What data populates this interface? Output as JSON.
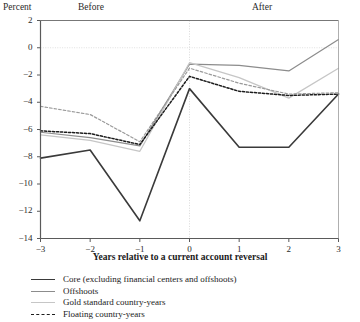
{
  "header": {
    "y_axis_unit_label": "Percent",
    "before_label": "Before",
    "after_label": "After"
  },
  "axis": {
    "x_title": "Years relative to a current account reversal"
  },
  "legend": {
    "items": [
      {
        "label": "Core (excluding financial centers and offshoots)",
        "color": "#3a3a3a",
        "style": "solid",
        "width": 1.6
      },
      {
        "label": "Offshoots",
        "color": "#8c8c8c",
        "style": "solid",
        "width": 1.2
      },
      {
        "label": "Gold standard country-years",
        "color": "#c6c6c6",
        "style": "solid",
        "width": 1.2
      },
      {
        "label": "Floating country-years",
        "color": "#1c1c1c",
        "style": "dashed",
        "width": 1.5
      }
    ]
  },
  "chart_data": {
    "type": "line",
    "title": "",
    "xlabel": "Years relative to a current account reversal",
    "ylabel": "Percent",
    "x": [
      -3,
      -2,
      -1,
      0,
      1,
      2,
      3
    ],
    "xtick_labels": [
      "−3",
      "−2",
      "−1",
      "0",
      "1",
      "2",
      "3"
    ],
    "ytick_labels": [
      "2",
      "0",
      "−2",
      "−4",
      "−6",
      "−8",
      "−10",
      "−12",
      "−14"
    ],
    "yticks": [
      2,
      0,
      -2,
      -4,
      -6,
      -8,
      -10,
      -12,
      -14
    ],
    "xlim": [
      -3,
      3
    ],
    "ylim": [
      -14,
      2
    ],
    "grid": "horizontal-zero-and-top",
    "legend_position": "below",
    "annotations": [
      {
        "text": "Before",
        "x": -1.7,
        "note": "region label left of reversal"
      },
      {
        "text": "After",
        "x": 1.3,
        "note": "region label right of reversal"
      },
      {
        "text": "reversal-marker",
        "x": 0,
        "note": "dotted vertical reference line at year 0"
      }
    ],
    "series": [
      {
        "name": "Core (excluding financial centers and offshoots)",
        "color": "#3a3a3a",
        "style": "solid",
        "width": 1.6,
        "values": [
          -8.1,
          -7.5,
          -12.7,
          -3.0,
          -7.3,
          -7.3,
          -3.4
        ]
      },
      {
        "name": "Offshoots",
        "color": "#8c8c8c",
        "style": "solid",
        "width": 1.2,
        "values": [
          -6.2,
          -6.6,
          -7.2,
          -1.2,
          -1.3,
          -1.7,
          0.6
        ]
      },
      {
        "name": "Gold standard country-years",
        "color": "#c6c6c6",
        "style": "solid",
        "width": 1.3,
        "values": [
          -6.4,
          -6.8,
          -7.6,
          -1.1,
          -2.2,
          -3.7,
          -1.5
        ]
      },
      {
        "name": "Floating country-years",
        "color": "#1c1c1c",
        "style": "dashed",
        "width": 1.5,
        "values": [
          -6.1,
          -6.3,
          -7.1,
          -2.1,
          -3.2,
          -3.5,
          -3.4
        ]
      },
      {
        "name": "Gold standard country-years (dashed variant)",
        "color": "#9a9a9a",
        "style": "dashed",
        "width": 1.2,
        "values": [
          -4.3,
          -4.9,
          -6.9,
          -1.5,
          -2.6,
          -3.4,
          -3.3
        ]
      }
    ]
  }
}
